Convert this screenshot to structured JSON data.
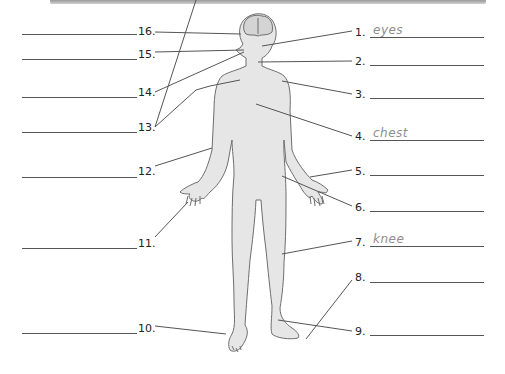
{
  "worksheet": {
    "title_bar_color": "#b5b5b5",
    "figure_fill": "#e6e6e6",
    "figure_stroke": "#6e6e6e",
    "answer_color": "#8e8e8e",
    "labels_right": [
      {
        "number": "1.",
        "answer": "eyes"
      },
      {
        "number": "2.",
        "answer": ""
      },
      {
        "number": "3.",
        "answer": ""
      },
      {
        "number": "4.",
        "answer": "chest"
      },
      {
        "number": "5.",
        "answer": ""
      },
      {
        "number": "6.",
        "answer": ""
      },
      {
        "number": "7.",
        "answer": "knee"
      },
      {
        "number": "8.",
        "answer": ""
      },
      {
        "number": "9.",
        "answer": ""
      }
    ],
    "labels_left": [
      {
        "number": "16.",
        "answer": ""
      },
      {
        "number": "15.",
        "answer": ""
      },
      {
        "number": "14.",
        "answer": ""
      },
      {
        "number": "13.",
        "answer": ""
      },
      {
        "number": "12.",
        "answer": ""
      },
      {
        "number": "11.",
        "answer": ""
      },
      {
        "number": "10.",
        "answer": ""
      }
    ]
  }
}
